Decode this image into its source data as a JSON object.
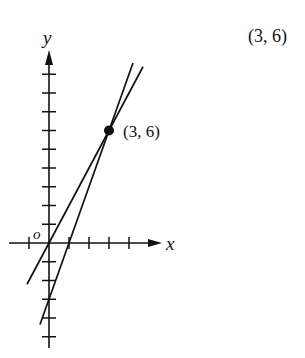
{
  "corner_label": "(3, 6)",
  "axes": {
    "x_label": "x",
    "y_label": "y",
    "origin_label": "o",
    "x_ticks": [
      -1,
      1,
      2,
      3,
      4
    ],
    "y_ticks": [
      -5,
      -4,
      -3,
      -2,
      -1,
      1,
      2,
      3,
      4,
      5,
      6,
      7,
      8,
      9
    ]
  },
  "point": {
    "x": 3,
    "y": 6,
    "label": "(3, 6)"
  },
  "lines": [
    {
      "name": "line-y-equals-2x",
      "equation": "y = 2x",
      "slope": 2,
      "intercept": 0,
      "x_from": -1.1,
      "x_to": 4.7
    },
    {
      "name": "line-y-equals-3x-minus-3",
      "equation": "y = 3x - 3",
      "slope": 3,
      "intercept": -3,
      "x_from": -0.45,
      "x_to": 4.2
    }
  ],
  "colors": {
    "ink": "#111111",
    "background": "#ffffff"
  },
  "chart_data": {
    "type": "line",
    "title": "",
    "xlabel": "x",
    "ylabel": "y",
    "xlim": [
      -2,
      5.5
    ],
    "ylim": [
      -5.5,
      10
    ],
    "grid": false,
    "series": [
      {
        "name": "y = 2x",
        "x": [
          -1.1,
          4.7
        ],
        "y": [
          -2.2,
          9.4
        ]
      },
      {
        "name": "y = 3x - 3",
        "x": [
          -0.45,
          4.2
        ],
        "y": [
          -4.35,
          9.6
        ]
      }
    ],
    "annotations": [
      {
        "type": "point",
        "x": 3,
        "y": 6,
        "text": "(3, 6)"
      },
      {
        "type": "text",
        "text": "(3, 6)",
        "position": "top-right"
      },
      {
        "type": "text",
        "text": "o",
        "position": "origin"
      }
    ]
  }
}
